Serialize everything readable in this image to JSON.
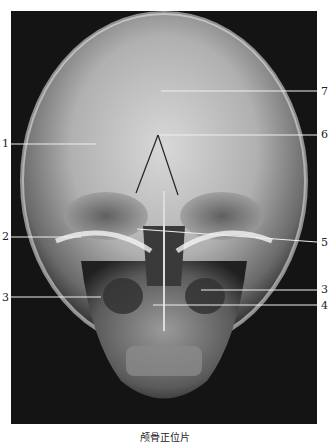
{
  "figure": {
    "caption": "颅骨正位片",
    "image_description": "Posteroanterior (frontal) skull X-ray radiograph",
    "labels": [
      {
        "id": "1",
        "text": "1",
        "side": "left"
      },
      {
        "id": "2",
        "text": "2",
        "side": "left"
      },
      {
        "id": "3a",
        "text": "3",
        "side": "left"
      },
      {
        "id": "7",
        "text": "7",
        "side": "right"
      },
      {
        "id": "6",
        "text": "6",
        "side": "right"
      },
      {
        "id": "5",
        "text": "5",
        "side": "right"
      },
      {
        "id": "3b",
        "text": "3",
        "side": "right"
      },
      {
        "id": "4",
        "text": "4",
        "side": "right"
      }
    ]
  }
}
